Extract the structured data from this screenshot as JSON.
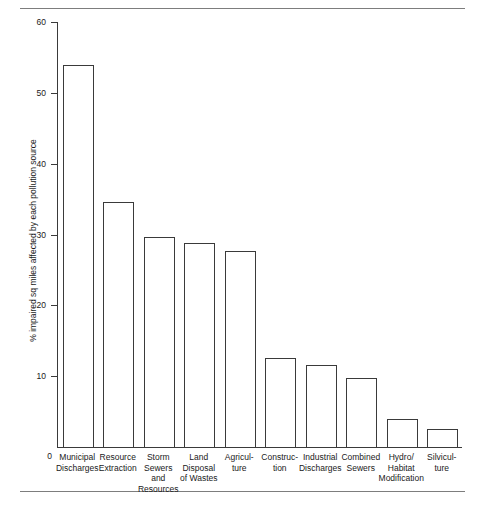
{
  "chart_data": {
    "type": "bar",
    "title": "",
    "xlabel": "",
    "ylabel": "% impaired sq miles affected by each pollution source",
    "ylim": [
      0,
      60
    ],
    "yticks": [
      0,
      10,
      20,
      30,
      40,
      50,
      60
    ],
    "ytick_labels": [
      "0",
      "10",
      "20",
      "30",
      "40",
      "50",
      "60"
    ],
    "grid": false,
    "legend": "none",
    "categories": [
      "Municipal\nDischarges",
      "Resource\nExtraction",
      "Storm\nSewers\nand\nResources",
      "Land\nDisposal\nof Wastes",
      "Agricul-\nture",
      "Construc-\ntion",
      "Industrial\nDischarges",
      "Combined\nSewers",
      "Hydro/\nHabitat\nModification",
      "Silvicul-\nture"
    ],
    "values": [
      54.0,
      34.6,
      29.6,
      28.8,
      27.7,
      12.6,
      11.6,
      9.8,
      3.9,
      2.6
    ],
    "bar_color": "#ffffff",
    "bar_edge_color": "#3a3a3a",
    "axis_color": "#3a3a3a",
    "rule_color": "#7d7d7d"
  }
}
